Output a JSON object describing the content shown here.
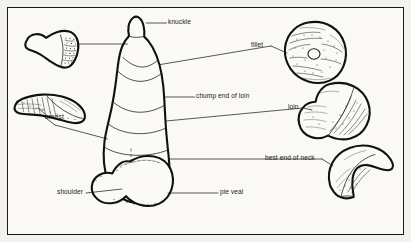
{
  "figure": {
    "background_color": "#faf9f6",
    "ink_color": "#111111",
    "border_color": "#1a1a1a"
  },
  "labels": [
    {
      "id": "knuckle",
      "text": "knuckle",
      "x": 168,
      "y": 21,
      "align": "left",
      "leader": "from label left edge to upper carcass"
    },
    {
      "id": "fillet",
      "text": "fillet",
      "x": 251,
      "y": 44,
      "align": "left",
      "leader": "from label right edge to fillet cut"
    },
    {
      "id": "chump-end-of-loin",
      "text": "chump end of loin",
      "x": 196,
      "y": 95,
      "align": "left",
      "leader": "from label left edge to mid carcass"
    },
    {
      "id": "loin",
      "text": "loin",
      "x": 288,
      "y": 106,
      "align": "left",
      "leader": "from label right edge to loin cut"
    },
    {
      "id": "breast",
      "text": "breast",
      "x": 45,
      "y": 115,
      "align": "left",
      "leader": "from label up to breast cut"
    },
    {
      "id": "best-end-of-neck",
      "text": "best end of neck",
      "x": 265,
      "y": 157,
      "align": "left",
      "leader": "from label right edge to neck cut"
    },
    {
      "id": "shoulder",
      "text": "shoulder",
      "x": 57,
      "y": 191,
      "align": "left",
      "leader": "from label right edge to shoulder"
    },
    {
      "id": "pie-veal",
      "text": "pie veal",
      "x": 220,
      "y": 191,
      "align": "left",
      "leader": "from label left edge to lower carcass"
    }
  ],
  "cuts": [
    {
      "id": "knuckle-cut",
      "name": "knuckle cut illustration"
    },
    {
      "id": "breast-cut",
      "name": "breast cut illustration"
    },
    {
      "id": "fillet-cut",
      "name": "fillet cut illustration"
    },
    {
      "id": "loin-cut",
      "name": "loin cut illustration"
    },
    {
      "id": "best-end-of-neck-cut",
      "name": "best end of neck cut illustration"
    },
    {
      "id": "carcass",
      "name": "whole veal leg carcass outline"
    },
    {
      "id": "shoulder-cut",
      "name": "shoulder cut illustration"
    }
  ]
}
